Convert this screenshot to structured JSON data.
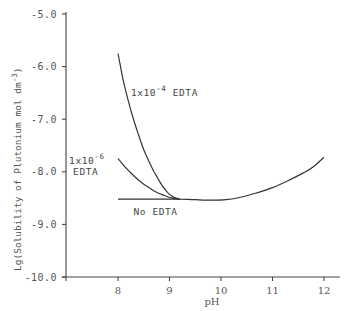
{
  "chart_data": {
    "type": "line",
    "title": "",
    "xlabel": "pH",
    "ylabel": "Lg(Solubility of Plutonium mol dm",
    "ylabel_superscript": "-3",
    "ylabel_suffix": ")",
    "xlim": [
      7.0,
      12.7
    ],
    "ylim": [
      -10.0,
      -5.0
    ],
    "x_ticks": [
      8,
      9,
      10,
      11,
      12
    ],
    "x_tick_labels": [
      "8",
      "9",
      "10",
      "11",
      "12"
    ],
    "y_ticks": [
      -5.0,
      -6.0,
      -7.0,
      -8.0,
      -9.0,
      -10.0
    ],
    "y_tick_labels": [
      "-5.0",
      "-6.0",
      "-7.0",
      "-8.0",
      "-9.0",
      "-10.0"
    ],
    "grid": false,
    "legend": "none",
    "series": [
      {
        "name": "1x10^-4 EDTA",
        "points": [
          [
            8.0,
            -5.75
          ],
          [
            8.1,
            -6.25
          ],
          [
            8.2,
            -6.65
          ],
          [
            8.3,
            -7.0
          ],
          [
            8.4,
            -7.3
          ],
          [
            8.5,
            -7.58
          ],
          [
            8.6,
            -7.8
          ],
          [
            8.7,
            -8.0
          ],
          [
            8.8,
            -8.17
          ],
          [
            8.9,
            -8.32
          ],
          [
            9.0,
            -8.43
          ],
          [
            9.1,
            -8.49
          ],
          [
            9.2,
            -8.52
          ]
        ]
      },
      {
        "name": "1x10^-6 EDTA",
        "points": [
          [
            8.0,
            -7.75
          ],
          [
            8.15,
            -7.92
          ],
          [
            8.3,
            -8.07
          ],
          [
            8.45,
            -8.2
          ],
          [
            8.6,
            -8.3
          ],
          [
            8.75,
            -8.39
          ],
          [
            8.9,
            -8.45
          ],
          [
            9.05,
            -8.5
          ],
          [
            9.2,
            -8.52
          ]
        ]
      },
      {
        "name": "No EDTA",
        "points": [
          [
            8.0,
            -8.52
          ],
          [
            8.5,
            -8.52
          ],
          [
            9.0,
            -8.52
          ],
          [
            9.2,
            -8.52
          ],
          [
            9.5,
            -8.53
          ],
          [
            9.8,
            -8.54
          ],
          [
            10.1,
            -8.53
          ],
          [
            10.4,
            -8.48
          ],
          [
            10.7,
            -8.4
          ],
          [
            11.0,
            -8.3
          ],
          [
            11.3,
            -8.17
          ],
          [
            11.6,
            -8.02
          ],
          [
            11.8,
            -7.9
          ],
          [
            12.0,
            -7.72
          ]
        ]
      }
    ],
    "annotations": [
      {
        "text_base": "1x10",
        "text_sup": "-4",
        "text_suffix": " EDTA",
        "x": 8.25,
        "y": -6.55
      },
      {
        "text_base": "1x10",
        "text_sup": "-6",
        "text_line2": "EDTA",
        "x": 7.05,
        "y": -7.85
      },
      {
        "text": "No EDTA",
        "x": 8.3,
        "y": -8.83
      }
    ]
  }
}
